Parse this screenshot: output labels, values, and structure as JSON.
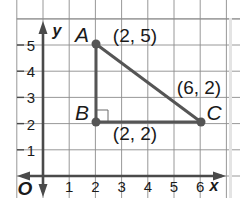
{
  "diagram": {
    "type": "coordinate-plane-triangle",
    "axes": {
      "x_label": "x",
      "y_label": "y",
      "origin_label": "O",
      "x_ticks": [
        "1",
        "2",
        "3",
        "4",
        "5",
        "6"
      ],
      "y_ticks": [
        "1",
        "2",
        "3",
        "4",
        "5"
      ],
      "x_range": [
        -1,
        7
      ],
      "y_range": [
        -1,
        6
      ]
    },
    "points": [
      {
        "name": "A",
        "coords": [
          2,
          5
        ],
        "coord_label": "(2, 5)"
      },
      {
        "name": "B",
        "coords": [
          2,
          2
        ],
        "coord_label": "(2, 2)"
      },
      {
        "name": "C",
        "coords": [
          6,
          2
        ],
        "coord_label": "(6, 2)"
      }
    ],
    "segments": [
      [
        "A",
        "B"
      ],
      [
        "B",
        "C"
      ],
      [
        "A",
        "C"
      ]
    ],
    "right_angle_at": "B",
    "colors": {
      "grid": "#8c8c8c",
      "axis": "#4a4a4a",
      "triangle": "#555555",
      "text": "#1a1a1a",
      "background": "#ffffff"
    }
  }
}
